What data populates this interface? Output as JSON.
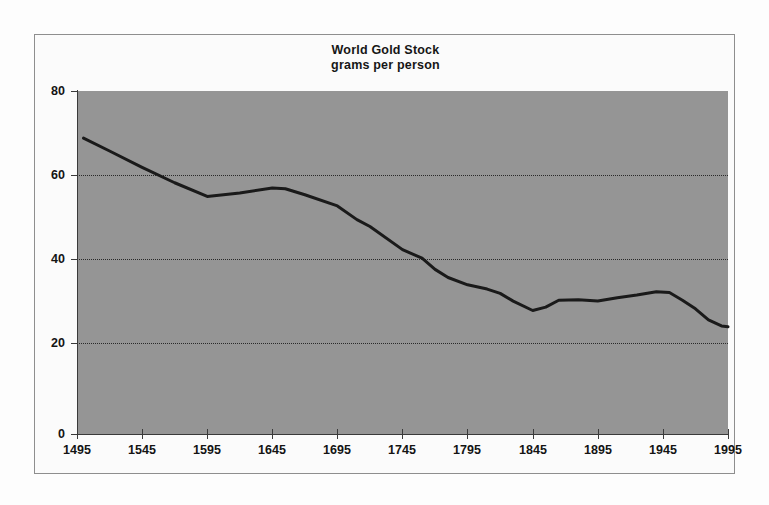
{
  "chart_data": {
    "type": "line",
    "title": "World Gold Stock",
    "subtitle": "grams per person",
    "xlabel": "",
    "ylabel": "",
    "xlim": [
      1495,
      1995
    ],
    "ylim": [
      0,
      80
    ],
    "yticks": [
      0,
      20,
      40,
      60,
      80
    ],
    "xticks": [
      1495,
      1545,
      1595,
      1645,
      1695,
      1745,
      1795,
      1845,
      1895,
      1945,
      1995
    ],
    "grid": "horizontal-dotted",
    "legend": "none",
    "plot_background": "#959595",
    "line_color": "#1a1a1a",
    "series": [
      {
        "name": "World Gold Stock (grams per person)",
        "x": [
          1500,
          1520,
          1545,
          1570,
          1595,
          1620,
          1645,
          1655,
          1670,
          1695,
          1710,
          1720,
          1745,
          1760,
          1770,
          1780,
          1795,
          1810,
          1820,
          1830,
          1845,
          1855,
          1865,
          1880,
          1895,
          1910,
          1925,
          1940,
          1950,
          1960,
          1970,
          1980,
          1990,
          1995
        ],
        "values": [
          69.0,
          66.0,
          62.2,
          58.6,
          55.4,
          56.2,
          57.4,
          57.2,
          55.8,
          53.2,
          50.0,
          48.4,
          43.0,
          41.0,
          38.4,
          36.5,
          34.8,
          33.8,
          32.8,
          31.0,
          28.8,
          29.6,
          31.2,
          31.3,
          31.0,
          31.8,
          32.4,
          33.2,
          33.0,
          31.2,
          29.2,
          26.6,
          25.2,
          25.0
        ]
      }
    ]
  },
  "labels": {
    "y": [
      "80",
      "60",
      "40",
      "20",
      "0"
    ],
    "x": [
      "1495",
      "1545",
      "1595",
      "1645",
      "1695",
      "1745",
      "1795",
      "1845",
      "1895",
      "1945",
      "1995"
    ]
  }
}
